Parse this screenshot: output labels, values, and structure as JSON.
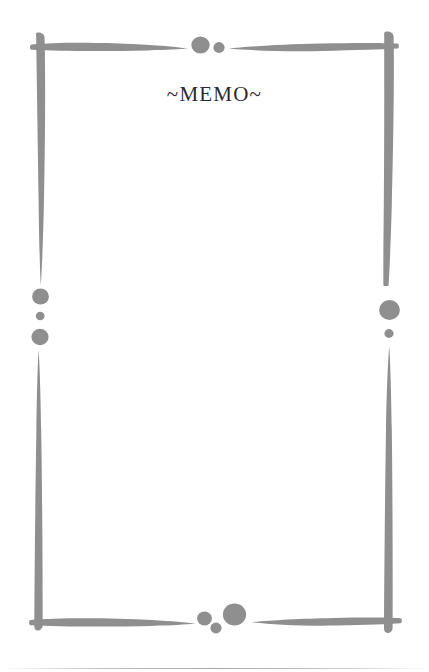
{
  "page": {
    "title": "~MEMO~",
    "background_color": "#ffffff",
    "width": 429,
    "height": 672
  },
  "decoration": {
    "style_name": "brush-stroke-frame",
    "stroke_color": "#8f8f8f",
    "dot_color": "#8f8f8f",
    "strokes": [
      {
        "name": "top-left-horizontal-stroke",
        "orientation": "horizontal"
      },
      {
        "name": "top-right-horizontal-stroke",
        "orientation": "horizontal"
      },
      {
        "name": "bottom-left-horizontal-stroke",
        "orientation": "horizontal"
      },
      {
        "name": "bottom-right-horizontal-stroke",
        "orientation": "horizontal"
      },
      {
        "name": "left-upper-vertical-stroke",
        "orientation": "vertical"
      },
      {
        "name": "left-lower-vertical-stroke",
        "orientation": "vertical"
      },
      {
        "name": "right-upper-vertical-stroke",
        "orientation": "vertical"
      },
      {
        "name": "right-lower-vertical-stroke",
        "orientation": "vertical"
      }
    ],
    "dots": [
      {
        "name": "top-large-dot",
        "size": "large"
      },
      {
        "name": "top-small-dot",
        "size": "small"
      },
      {
        "name": "left-medium-dot",
        "size": "medium"
      },
      {
        "name": "left-small-dot",
        "size": "small"
      },
      {
        "name": "left-large-dot",
        "size": "large"
      },
      {
        "name": "right-large-dot",
        "size": "large"
      },
      {
        "name": "right-small-dot",
        "size": "small"
      },
      {
        "name": "bottom-medium-dot",
        "size": "medium"
      },
      {
        "name": "bottom-small-dot",
        "size": "small"
      },
      {
        "name": "bottom-large-dot",
        "size": "large"
      }
    ]
  },
  "writing_area": {
    "content": "",
    "placeholder": ""
  }
}
